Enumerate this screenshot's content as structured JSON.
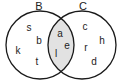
{
  "diagram": {
    "type": "venn",
    "sets": [
      {
        "name": "B",
        "elements_only": [
          "s",
          "b",
          "k",
          "t"
        ]
      },
      {
        "name": "C",
        "elements_only": [
          "c",
          "h",
          "r",
          "d"
        ]
      }
    ],
    "intersection": [
      "a",
      "e",
      "l"
    ],
    "colors": {
      "outline": "#1a1a1a",
      "intersection_fill": "#e2e2e2",
      "background": "#ffffff"
    }
  },
  "labels": {
    "set_b": "B",
    "set_c": "C"
  },
  "elements": {
    "b_only": {
      "s": "s",
      "b": "b",
      "k": "k",
      "t": "t"
    },
    "both": {
      "a": "a",
      "e": "e",
      "l": "l"
    },
    "c_only": {
      "c": "c",
      "h": "h",
      "r": "r",
      "d": "d"
    }
  }
}
